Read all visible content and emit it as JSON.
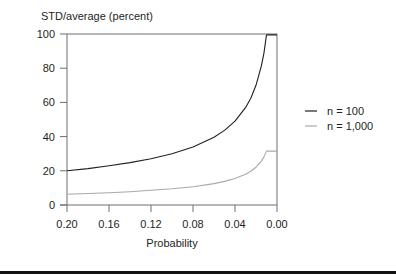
{
  "chart_data": {
    "type": "line",
    "title": "STD/average (percent)",
    "xlabel": "Probability",
    "ylabel": "STD/average (percent)",
    "xlim": [
      0.2,
      0.0
    ],
    "ylim": [
      0,
      100
    ],
    "x_reversed": true,
    "grid": false,
    "legend_position": "right",
    "xticks": [
      "0.20",
      "0.16",
      "0.12",
      "0.08",
      "0.04",
      "0.00"
    ],
    "yticks": [
      "0",
      "20",
      "40",
      "60",
      "80",
      "100"
    ],
    "x": [
      0.2,
      0.18,
      0.16,
      0.14,
      0.12,
      0.1,
      0.08,
      0.06,
      0.05,
      0.04,
      0.03,
      0.025,
      0.02,
      0.015,
      0.0125,
      0.01
    ],
    "series": [
      {
        "name": "n = 100",
        "color": "#231f20",
        "values": [
          20.0,
          21.3,
          22.9,
          24.8,
          27.1,
          30.0,
          33.9,
          39.6,
          43.6,
          49.0,
          56.9,
          62.4,
          70.0,
          81.2,
          88.7,
          99.5
        ]
      },
      {
        "name": "n = 1,000",
        "color": "#a7a9ac",
        "values": [
          6.3,
          6.7,
          7.2,
          7.8,
          8.6,
          9.5,
          10.7,
          12.5,
          13.8,
          15.5,
          18.0,
          19.7,
          22.1,
          25.7,
          28.0,
          31.5
        ]
      }
    ]
  }
}
